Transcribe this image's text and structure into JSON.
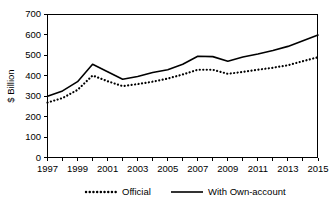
{
  "chart_data": {
    "type": "line",
    "title": "",
    "subtitle": "",
    "xlabel": "",
    "ylabel": "$ Billion",
    "x": [
      1997,
      1998,
      1999,
      2000,
      2001,
      2002,
      2003,
      2004,
      2005,
      2006,
      2007,
      2008,
      2009,
      2010,
      2011,
      2012,
      2013,
      2014,
      2015
    ],
    "xtick_labels": [
      "1997",
      "1999",
      "2001",
      "2003",
      "2005",
      "2007",
      "2009",
      "2011",
      "2013",
      "2015"
    ],
    "xtick_values": [
      1997,
      1999,
      2001,
      2003,
      2005,
      2007,
      2009,
      2011,
      2013,
      2015
    ],
    "ytick_labels": [
      "0",
      "100",
      "200",
      "300",
      "400",
      "500",
      "600",
      "700"
    ],
    "ytick_values": [
      0,
      100,
      200,
      300,
      400,
      500,
      600,
      700
    ],
    "xlim": [
      1997,
      2015
    ],
    "ylim": [
      0,
      700
    ],
    "grid": false,
    "legend_position": "bottom",
    "series": [
      {
        "name": "Official",
        "style": "dotted",
        "color": "#000000",
        "values": [
          268,
          290,
          330,
          400,
          372,
          348,
          358,
          370,
          385,
          405,
          428,
          428,
          408,
          418,
          428,
          438,
          450,
          470,
          489
        ]
      },
      {
        "name": "With Own-account",
        "style": "solid",
        "color": "#000000",
        "values": [
          299,
          325,
          370,
          455,
          418,
          382,
          395,
          415,
          428,
          455,
          494,
          492,
          470,
          490,
          505,
          522,
          542,
          570,
          597
        ]
      }
    ]
  },
  "legend": {
    "items": [
      {
        "label": "Official",
        "style": "dotted"
      },
      {
        "label": "With Own-account",
        "style": "solid"
      }
    ]
  },
  "axes": {
    "y_title": "$ Billion"
  }
}
